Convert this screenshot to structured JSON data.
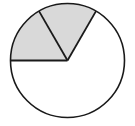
{
  "figure": {
    "center": [
      67.5,
      60.5
    ],
    "radius": 57,
    "stroke_color": "#1a1a1a",
    "shaded_color": "#d9d9d9",
    "unshaded_color": "#ffffff"
  },
  "chart_data": {
    "type": "pie",
    "title": "",
    "categories": [
      "Shaded sector 1",
      "Shaded sector 2",
      "Unshaded"
    ],
    "values": [
      60,
      60,
      240
    ],
    "units": "degrees",
    "fractions": [
      "1/6",
      "1/6",
      "2/3"
    ],
    "start_angles_deg": [
      60,
      120,
      180
    ],
    "end_angles_deg": [
      120,
      180,
      420
    ],
    "shaded": [
      true,
      true,
      false
    ],
    "labels_visible": false,
    "legend": null
  }
}
